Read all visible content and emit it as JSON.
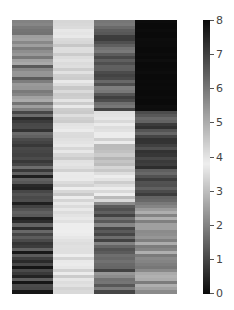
{
  "chart_data": {
    "type": "heatmap",
    "title": "",
    "xlabel": "",
    "ylabel": "",
    "columns": 4,
    "rows_per_block": 30,
    "colorbar": {
      "min": 0,
      "max": 8,
      "ticks": [
        "0",
        "1",
        "2",
        "3",
        "4",
        "5",
        "6",
        "7",
        "8"
      ],
      "colormap": "gray-diverging: 0=black, ~3.8=lightest, 8=black"
    },
    "blocks": [
      {
        "rows": "1-30",
        "column_means": [
          5.8,
          4.2,
          6.5,
          8.0
        ],
        "column_spread": [
          0.5,
          0.2,
          0.4,
          0.05
        ]
      },
      {
        "rows": "31-60",
        "column_means": [
          6.9,
          3.7,
          4.3,
          6.8
        ],
        "column_spread": [
          0.5,
          0.35,
          0.35,
          0.35
        ]
      },
      {
        "rows": "61-90",
        "column_means": [
          0.9,
          3.7,
          1.6,
          2.3
        ],
        "column_spread": [
          0.45,
          0.3,
          0.5,
          0.3
        ]
      }
    ]
  }
}
